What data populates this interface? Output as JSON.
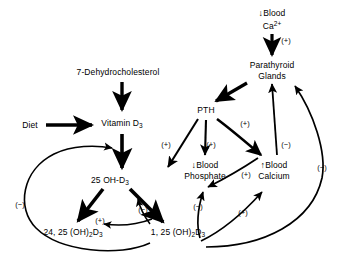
{
  "diagram": {
    "type": "flow-diagram",
    "background_color": "#ffffff",
    "line_color": "#000000",
    "text_color": "#000000",
    "nodes": [
      {
        "id": "dehydrocholesterol",
        "label": "7-Dehydrocholesterol",
        "x": 118,
        "y": 72
      },
      {
        "id": "diet",
        "label": "Diet",
        "x": 30,
        "y": 125
      },
      {
        "id": "vitamin-d3",
        "label": "Vitamin D",
        "sub": "3",
        "x": 122,
        "y": 124
      },
      {
        "id": "25-oh-d3",
        "label": "25 OH-D",
        "sub": "3",
        "x": 110,
        "y": 181
      },
      {
        "id": "24-25-oh2-d3",
        "label": "24, 25 (OH)",
        "sub": "2",
        "label2": "D",
        "sub2": "3",
        "x": 73,
        "y": 233
      },
      {
        "id": "1-25-oh2-d3",
        "label": "1, 25 (OH)",
        "sub": "2",
        "label2": "D",
        "sub2": "3",
        "x": 178,
        "y": 233
      },
      {
        "id": "blood-ca-low",
        "line1": "Blood",
        "line2": "Ca",
        "sup": "2+",
        "arrow": "down",
        "x": 272,
        "y": 19
      },
      {
        "id": "parathyroid-glands",
        "line1": "Parathyroid",
        "line2": "Glands",
        "x": 272,
        "y": 70
      },
      {
        "id": "pth",
        "label": "PTH",
        "x": 206,
        "y": 110
      },
      {
        "id": "blood-phosphate",
        "line1": "Blood",
        "line2": "Phosphate",
        "arrow": "down",
        "x": 205,
        "y": 170
      },
      {
        "id": "blood-calcium",
        "line1": "Blood",
        "line2": "Calcium",
        "arrow": "up",
        "x": 274,
        "y": 170
      }
    ],
    "signs": [
      {
        "id": "sign-ca-to-parathyroid",
        "text": "(+)",
        "x": 286,
        "y": 41
      },
      {
        "id": "sign-pth-to-phosphate",
        "text": "(+)",
        "x": 211,
        "y": 145
      },
      {
        "id": "sign-pth-to-calcium",
        "text": "(+)",
        "x": 245,
        "y": 124
      },
      {
        "id": "sign-pth-to-1-25",
        "text": "(+)",
        "x": 166,
        "y": 145
      },
      {
        "id": "sign-1-25-to-25oh",
        "text": "(+)",
        "x": 246,
        "y": 175
      },
      {
        "id": "sign-calcium-to-parathyroid",
        "text": "(−)",
        "x": 286,
        "y": 145
      },
      {
        "id": "sign-feedback-right",
        "text": "(−)",
        "x": 322,
        "y": 168
      },
      {
        "id": "sign-feedback-left",
        "text": "(−)",
        "x": 20,
        "y": 205
      },
      {
        "id": "sign-24-25-to-25oh",
        "text": "(+)",
        "x": 100,
        "y": 221
      },
      {
        "id": "sign-1-25-inhibit",
        "text": "(−)",
        "x": 143,
        "y": 210
      },
      {
        "id": "sign-1-25-to-phosphate",
        "text": "(−)",
        "x": 198,
        "y": 207
      },
      {
        "id": "sign-1-25-to-calcium",
        "text": "(+)",
        "x": 243,
        "y": 213
      }
    ],
    "edges": [
      {
        "id": "edge-dehydrocholesterol-to-vitamin-d3",
        "from": "dehydrocholesterol",
        "to": "vitamin-d3",
        "style": "thick-straight"
      },
      {
        "id": "edge-diet-to-vitamin-d3",
        "from": "diet",
        "to": "vitamin-d3",
        "style": "thick-straight"
      },
      {
        "id": "edge-vitamin-d3-to-25-oh-d3",
        "from": "vitamin-d3",
        "to": "25-oh-d3",
        "style": "thick-straight"
      },
      {
        "id": "edge-25-oh-d3-to-24-25",
        "from": "25-oh-d3",
        "to": "24-25-oh2-d3",
        "style": "thick-straight"
      },
      {
        "id": "edge-25-oh-d3-to-1-25",
        "from": "25-oh-d3",
        "to": "1-25-oh2-d3",
        "style": "thick-straight"
      },
      {
        "id": "edge-24-25-to-1-25-inhibit",
        "from": "1-25-oh2-d3",
        "to": "24-25-oh2-d3",
        "style": "thin-curve",
        "sign": "(+)"
      },
      {
        "id": "edge-1-25-to-25-oh-inhibit",
        "from": "1-25-oh2-d3",
        "to": "25-oh-d3",
        "style": "thin-curve",
        "sign": "(−)"
      },
      {
        "id": "edge-feedback-left-loop",
        "from": "24-25-oh2-d3",
        "to": "25-oh-d3",
        "style": "thin-curve",
        "sign": "(−)"
      },
      {
        "id": "edge-blood-ca-to-parathyroid",
        "from": "blood-ca-low",
        "to": "parathyroid-glands",
        "style": "thick-straight",
        "sign": "(+)"
      },
      {
        "id": "edge-parathyroid-to-pth",
        "from": "parathyroid-glands",
        "to": "pth",
        "style": "thick-straight"
      },
      {
        "id": "edge-pth-to-1-25",
        "from": "pth",
        "to": "1-25-oh2-d3",
        "style": "thick-straight",
        "sign": "(+)"
      },
      {
        "id": "edge-pth-to-phosphate",
        "from": "pth",
        "to": "blood-phosphate",
        "style": "thick-straight",
        "sign": "(+)"
      },
      {
        "id": "edge-pth-to-calcium",
        "from": "pth",
        "to": "blood-calcium",
        "style": "thick-curve",
        "sign": "(+)"
      },
      {
        "id": "edge-1-25-to-phosphate",
        "from": "1-25-oh2-d3",
        "to": "blood-phosphate",
        "style": "thin-curve",
        "sign": "(−)"
      },
      {
        "id": "edge-1-25-to-calcium",
        "from": "1-25-oh2-d3",
        "to": "blood-calcium",
        "style": "thin-curve",
        "sign": "(+)"
      },
      {
        "id": "edge-calcium-to-parathyroid",
        "from": "blood-calcium",
        "to": "parathyroid-glands",
        "style": "thin-straight",
        "sign": "(−)"
      },
      {
        "id": "edge-1-25-to-parathyroid",
        "from": "1-25-oh2-d3",
        "to": "parathyroid-glands",
        "style": "thin-curve",
        "sign": "(−)"
      },
      {
        "id": "edge-1-25-to-25oh-stimulate",
        "from": "blood-calcium",
        "to": "25-oh-d3",
        "style": "thin-curve",
        "sign": "(+)"
      }
    ]
  }
}
